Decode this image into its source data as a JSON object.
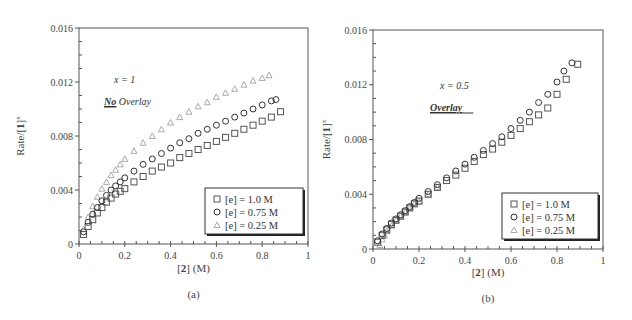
{
  "chart_data": [
    {
      "type": "scatter",
      "panel_label": "(a)",
      "xlabel": "[2] (M)",
      "ylabel": "Rate/[1]^x",
      "xlim": [
        0,
        1
      ],
      "ylim": [
        0,
        0.016
      ],
      "xticks": [
        "0",
        "0.2",
        "0.4",
        "0.6",
        "0.8",
        "1"
      ],
      "yticks": [
        "0",
        "0.004",
        "0.008",
        "0.012",
        "0.016"
      ],
      "annotations": [
        "x = 1",
        "No Overlay"
      ],
      "legend_position": "lower right",
      "series": [
        {
          "name": "[e] = 1.0 M",
          "marker": "square",
          "color": "#555555",
          "x": [
            0.02,
            0.04,
            0.06,
            0.08,
            0.1,
            0.12,
            0.14,
            0.16,
            0.18,
            0.2,
            0.24,
            0.28,
            0.32,
            0.36,
            0.4,
            0.44,
            0.48,
            0.52,
            0.56,
            0.6,
            0.64,
            0.68,
            0.72,
            0.76,
            0.8,
            0.84,
            0.88
          ],
          "y": [
            0.0007,
            0.0013,
            0.0018,
            0.0023,
            0.0027,
            0.0031,
            0.0034,
            0.0037,
            0.0039,
            0.0041,
            0.0046,
            0.005,
            0.0054,
            0.0057,
            0.006,
            0.0064,
            0.0067,
            0.007,
            0.0073,
            0.0076,
            0.0079,
            0.0082,
            0.0085,
            0.0088,
            0.0091,
            0.0094,
            0.0098
          ]
        },
        {
          "name": "[e] = 0.75 M",
          "marker": "circle",
          "color": "#333333",
          "x": [
            0.02,
            0.04,
            0.06,
            0.08,
            0.1,
            0.12,
            0.14,
            0.16,
            0.18,
            0.2,
            0.24,
            0.28,
            0.32,
            0.36,
            0.4,
            0.44,
            0.48,
            0.52,
            0.56,
            0.6,
            0.64,
            0.68,
            0.72,
            0.76,
            0.8,
            0.84,
            0.86
          ],
          "y": [
            0.0009,
            0.0016,
            0.0022,
            0.0027,
            0.0032,
            0.0036,
            0.004,
            0.0043,
            0.0046,
            0.0049,
            0.0054,
            0.0059,
            0.0063,
            0.0067,
            0.0071,
            0.0075,
            0.0078,
            0.0082,
            0.0085,
            0.0088,
            0.0091,
            0.0094,
            0.0097,
            0.01,
            0.0103,
            0.0106,
            0.0107
          ]
        },
        {
          "name": "[e] = 0.25 M",
          "marker": "triangle",
          "color": "#aaaaaa",
          "x": [
            0.02,
            0.04,
            0.06,
            0.08,
            0.1,
            0.12,
            0.14,
            0.16,
            0.18,
            0.2,
            0.24,
            0.28,
            0.32,
            0.36,
            0.4,
            0.44,
            0.48,
            0.52,
            0.56,
            0.6,
            0.64,
            0.68,
            0.72,
            0.76,
            0.8,
            0.83
          ],
          "y": [
            0.0011,
            0.002,
            0.0028,
            0.0035,
            0.0041,
            0.0046,
            0.0051,
            0.0055,
            0.0059,
            0.0063,
            0.0069,
            0.0075,
            0.008,
            0.0085,
            0.009,
            0.0094,
            0.0098,
            0.0102,
            0.0105,
            0.0109,
            0.0112,
            0.0115,
            0.0118,
            0.0121,
            0.0123,
            0.0125
          ]
        }
      ]
    },
    {
      "type": "scatter",
      "panel_label": "(b)",
      "xlabel": "[2] (M)",
      "ylabel": "Rate/[1]^x",
      "xlim": [
        0,
        1
      ],
      "ylim": [
        0,
        0.016
      ],
      "xticks": [
        "0",
        "0.2",
        "0.4",
        "0.6",
        "0.8",
        "1"
      ],
      "yticks": [
        "0",
        "0.004",
        "0.008",
        "0.012",
        "0.016"
      ],
      "annotations": [
        "x = 0.5",
        "Overlay"
      ],
      "legend_position": "lower right",
      "series": [
        {
          "name": "[e] = 1.0 M",
          "marker": "square",
          "color": "#555555",
          "x": [
            0.02,
            0.04,
            0.06,
            0.08,
            0.1,
            0.12,
            0.14,
            0.16,
            0.18,
            0.2,
            0.24,
            0.28,
            0.32,
            0.36,
            0.4,
            0.44,
            0.48,
            0.52,
            0.56,
            0.6,
            0.64,
            0.68,
            0.72,
            0.76,
            0.8,
            0.84,
            0.89
          ],
          "y": [
            0.0005,
            0.001,
            0.0014,
            0.0018,
            0.0021,
            0.0024,
            0.0027,
            0.003,
            0.0033,
            0.0035,
            0.004,
            0.0045,
            0.005,
            0.0054,
            0.0059,
            0.0064,
            0.0069,
            0.0073,
            0.0078,
            0.0083,
            0.0088,
            0.0093,
            0.0098,
            0.0103,
            0.0113,
            0.0124,
            0.0135
          ]
        },
        {
          "name": "[e] = 0.75 M",
          "marker": "circle",
          "color": "#333333",
          "x": [
            0.02,
            0.04,
            0.06,
            0.08,
            0.1,
            0.12,
            0.14,
            0.16,
            0.18,
            0.2,
            0.24,
            0.28,
            0.32,
            0.36,
            0.4,
            0.44,
            0.48,
            0.52,
            0.56,
            0.6,
            0.64,
            0.68,
            0.72,
            0.76,
            0.8,
            0.83,
            0.865
          ],
          "y": [
            0.0006,
            0.0011,
            0.0015,
            0.0019,
            0.0022,
            0.0025,
            0.0028,
            0.0031,
            0.0034,
            0.0037,
            0.0042,
            0.0047,
            0.0052,
            0.0057,
            0.0062,
            0.0067,
            0.0072,
            0.0077,
            0.0082,
            0.0088,
            0.0094,
            0.01,
            0.0107,
            0.0113,
            0.0122,
            0.013,
            0.0136
          ]
        },
        {
          "name": "[e] = 0.25 M",
          "marker": "triangle",
          "color": "#aaaaaa",
          "x": [
            0.03,
            0.04,
            0.05,
            0.06,
            0.08,
            0.1,
            0.12,
            0.14,
            0.16,
            0.18,
            0.2,
            0.24,
            0.28
          ],
          "y": [
            0.0003,
            0.0007,
            0.001,
            0.0013,
            0.0017,
            0.0021,
            0.0024,
            0.0027,
            0.003,
            0.0033,
            0.0035,
            0.004,
            0.0045
          ]
        }
      ]
    }
  ],
  "panels": [
    {
      "label": "(a)",
      "annotation_x": "x = 1",
      "annotation_overlay_emph": "No",
      "annotation_overlay_rest": " Overlay",
      "ylabel": "Rate/[1]",
      "ylabel_sup": "x",
      "xlabel_bold": "2",
      "xlabel_rest": " (M)",
      "legend": [
        "[e] = 1.0 M",
        "[e] = 0.75 M",
        "[e] = 0.25 M"
      ]
    },
    {
      "label": "(b)",
      "annotation_x": "x = 0.5",
      "annotation_overlay_emph": "Overlay",
      "annotation_overlay_rest": "",
      "ylabel": "Rate/[1]",
      "ylabel_sup": "x",
      "xlabel_bold": "2",
      "xlabel_rest": " (M)",
      "legend": [
        "[e] = 1.0 M",
        "[e] = 0.75 M",
        "[e] = 0.25 M"
      ]
    }
  ]
}
